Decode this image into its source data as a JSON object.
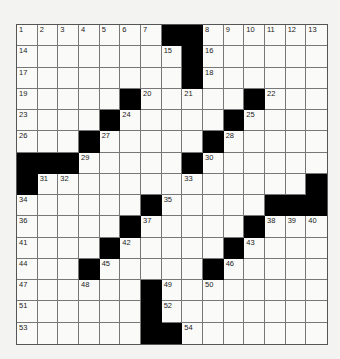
{
  "puzzle": {
    "rows": 15,
    "cols": 15,
    "colors": {
      "background": "#f3f3f1",
      "cell": "#fafaf8",
      "block": "#000000",
      "gridline": "#777777"
    },
    "blocks": [
      [
        0,
        7
      ],
      [
        0,
        8
      ],
      [
        1,
        8
      ],
      [
        2,
        8
      ],
      [
        3,
        5
      ],
      [
        3,
        11
      ],
      [
        4,
        4
      ],
      [
        4,
        10
      ],
      [
        5,
        3
      ],
      [
        5,
        9
      ],
      [
        6,
        0
      ],
      [
        6,
        1
      ],
      [
        6,
        2
      ],
      [
        6,
        8
      ],
      [
        7,
        0
      ],
      [
        7,
        14
      ],
      [
        8,
        6
      ],
      [
        8,
        12
      ],
      [
        8,
        13
      ],
      [
        8,
        14
      ],
      [
        9,
        5
      ],
      [
        9,
        11
      ],
      [
        10,
        4
      ],
      [
        10,
        10
      ],
      [
        11,
        3
      ],
      [
        11,
        9
      ],
      [
        12,
        6
      ],
      [
        13,
        6
      ],
      [
        14,
        6
      ],
      [
        14,
        7
      ]
    ],
    "numbers": [
      {
        "r": 0,
        "c": 0,
        "n": "1"
      },
      {
        "r": 0,
        "c": 1,
        "n": "2"
      },
      {
        "r": 0,
        "c": 2,
        "n": "3"
      },
      {
        "r": 0,
        "c": 3,
        "n": "4"
      },
      {
        "r": 0,
        "c": 4,
        "n": "5"
      },
      {
        "r": 0,
        "c": 5,
        "n": "6"
      },
      {
        "r": 0,
        "c": 6,
        "n": "7"
      },
      {
        "r": 0,
        "c": 9,
        "n": "8"
      },
      {
        "r": 0,
        "c": 10,
        "n": "9"
      },
      {
        "r": 0,
        "c": 11,
        "n": "10"
      },
      {
        "r": 0,
        "c": 12,
        "n": "11"
      },
      {
        "r": 0,
        "c": 13,
        "n": "12"
      },
      {
        "r": 0,
        "c": 14,
        "n": "13"
      },
      {
        "r": 1,
        "c": 0,
        "n": "14"
      },
      {
        "r": 1,
        "c": 7,
        "n": "15"
      },
      {
        "r": 1,
        "c": 9,
        "n": "16"
      },
      {
        "r": 2,
        "c": 0,
        "n": "17"
      },
      {
        "r": 2,
        "c": 9,
        "n": "18"
      },
      {
        "r": 3,
        "c": 0,
        "n": "19"
      },
      {
        "r": 3,
        "c": 6,
        "n": "20"
      },
      {
        "r": 3,
        "c": 8,
        "n": "21"
      },
      {
        "r": 3,
        "c": 12,
        "n": "22"
      },
      {
        "r": 4,
        "c": 0,
        "n": "23"
      },
      {
        "r": 4,
        "c": 5,
        "n": "24"
      },
      {
        "r": 4,
        "c": 11,
        "n": "25"
      },
      {
        "r": 5,
        "c": 0,
        "n": "26"
      },
      {
        "r": 5,
        "c": 4,
        "n": "27"
      },
      {
        "r": 5,
        "c": 10,
        "n": "28"
      },
      {
        "r": 6,
        "c": 3,
        "n": "29"
      },
      {
        "r": 6,
        "c": 9,
        "n": "30"
      },
      {
        "r": 7,
        "c": 1,
        "n": "31"
      },
      {
        "r": 7,
        "c": 2,
        "n": "32"
      },
      {
        "r": 7,
        "c": 8,
        "n": "33"
      },
      {
        "r": 8,
        "c": 0,
        "n": "34"
      },
      {
        "r": 8,
        "c": 7,
        "n": "35"
      },
      {
        "r": 9,
        "c": 0,
        "n": "36"
      },
      {
        "r": 9,
        "c": 6,
        "n": "37"
      },
      {
        "r": 9,
        "c": 12,
        "n": "38"
      },
      {
        "r": 9,
        "c": 13,
        "n": "39"
      },
      {
        "r": 9,
        "c": 14,
        "n": "40"
      },
      {
        "r": 10,
        "c": 0,
        "n": "41"
      },
      {
        "r": 10,
        "c": 5,
        "n": "42"
      },
      {
        "r": 10,
        "c": 11,
        "n": "43"
      },
      {
        "r": 11,
        "c": 0,
        "n": "44"
      },
      {
        "r": 11,
        "c": 4,
        "n": "45"
      },
      {
        "r": 11,
        "c": 10,
        "n": "46"
      },
      {
        "r": 12,
        "c": 0,
        "n": "47"
      },
      {
        "r": 12,
        "c": 3,
        "n": "48"
      },
      {
        "r": 12,
        "c": 7,
        "n": "49"
      },
      {
        "r": 12,
        "c": 9,
        "n": "50"
      },
      {
        "r": 13,
        "c": 0,
        "n": "51"
      },
      {
        "r": 13,
        "c": 7,
        "n": "52"
      },
      {
        "r": 14,
        "c": 0,
        "n": "53"
      },
      {
        "r": 14,
        "c": 8,
        "n": "54"
      }
    ]
  }
}
